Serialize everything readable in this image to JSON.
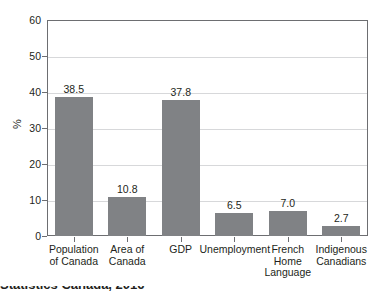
{
  "chart_data": {
    "type": "bar",
    "title": "",
    "subtitle": "",
    "xlabel": "",
    "ylabel": "%",
    "ylim": [
      0,
      60
    ],
    "yticks": [
      0,
      10,
      20,
      30,
      40,
      50,
      60
    ],
    "grid": true,
    "legend": false,
    "bar_color": "#808285",
    "categories": [
      "Population of Canada",
      "Area of Canada",
      "GDP",
      "Unemployment",
      "French Home Language",
      "Indigenous Canadians"
    ],
    "category_lines": [
      [
        "Population",
        "of Canada"
      ],
      [
        "Area of",
        "Canada"
      ],
      [
        "GDP"
      ],
      [
        "Unemployment"
      ],
      [
        "French",
        "Home",
        "Language"
      ],
      [
        "Indigenous",
        "Canadians"
      ]
    ],
    "values": [
      38.5,
      10.8,
      37.8,
      6.5,
      7.0,
      2.7
    ],
    "value_labels": [
      "38.5",
      "10.8",
      "37.8",
      "6.5",
      "7.0",
      "2.7"
    ]
  },
  "caption": {
    "text": "Statistics Canada, 2016"
  }
}
